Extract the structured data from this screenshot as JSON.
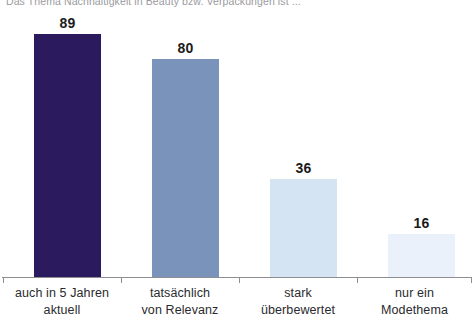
{
  "chart_data": {
    "type": "bar",
    "title": "Das Thema Nachhaltigkeit in Beauty bzw. Verpackungen ist ...",
    "subtitle": "",
    "xlabel": "",
    "ylabel": "",
    "ylim": [
      0,
      100
    ],
    "grid": false,
    "legend": "none",
    "categories": [
      "auch in 5 Jahren aktuell",
      "tatsächlich von Relevanz",
      "stark überbewertet",
      "nur ein Modethema"
    ],
    "category_lines": [
      [
        "auch in 5 Jahren",
        "aktuell"
      ],
      [
        "tatsächlich",
        "von Relevanz"
      ],
      [
        "stark",
        "überbewertet"
      ],
      [
        "nur ein",
        "Modethema"
      ]
    ],
    "values": [
      89,
      80,
      36,
      16
    ],
    "value_labels": [
      "89",
      "80",
      "36",
      "16"
    ],
    "bar_colors": [
      "#2b1b5e",
      "#7993bb",
      "#d5e4f3",
      "#eaf1fa"
    ],
    "axis_color": "#8e8e92",
    "value_label_color": "#1b1b1b",
    "background": "#ffffff"
  }
}
